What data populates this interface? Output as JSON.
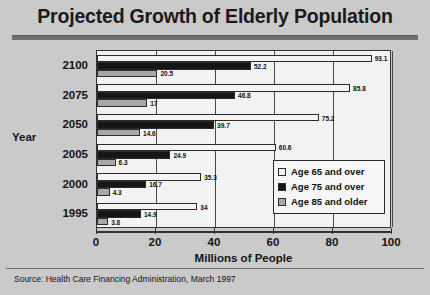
{
  "title": "Projected Growth of Elderly Population",
  "source": "Source:  Health Care Financing Administration, March 1997",
  "legend": {
    "items": [
      {
        "label": "Age 65 and over",
        "key": "s65",
        "color": "#f4f4f4"
      },
      {
        "label": "Age 75 and over",
        "key": "s75",
        "color": "#161616"
      },
      {
        "label": "Age 85 and older",
        "key": "s85",
        "color": "#a8a8a8"
      }
    ]
  },
  "chart_data": {
    "type": "bar",
    "orientation": "horizontal",
    "title": "Projected Growth of Elderly Population",
    "xlabel": "Millions of People",
    "ylabel": "Year",
    "xlim": [
      0,
      100
    ],
    "xticks": [
      0,
      20,
      40,
      60,
      80,
      100
    ],
    "grid": true,
    "legend_position": "inside-bottom-right",
    "categories": [
      "2100",
      "2075",
      "2050",
      "2005",
      "2000",
      "1995"
    ],
    "series": [
      {
        "name": "Age 65 and over",
        "values": [
          93.1,
          85.8,
          75.2,
          60.6,
          35.3,
          34
        ]
      },
      {
        "name": "Age 75 and over",
        "values": [
          52.2,
          46.8,
          39.7,
          24.9,
          16.7,
          14.9
        ]
      },
      {
        "name": "Age 85 and older",
        "values": [
          20.5,
          17,
          14.6,
          6.3,
          4.3,
          3.8
        ]
      }
    ],
    "value_labels": {
      "2100": [
        "93.1",
        "52.2",
        "20.5"
      ],
      "2075": [
        "85.8",
        "46.8",
        "17"
      ],
      "2050": [
        "75.2",
        "39.7",
        "14.6"
      ],
      "2005": [
        "60.6",
        "24.9",
        "6.3"
      ],
      "2000": [
        "35.3",
        "16.7",
        "4.3"
      ],
      "1995": [
        "34",
        "14.9",
        "3.8"
      ]
    }
  }
}
